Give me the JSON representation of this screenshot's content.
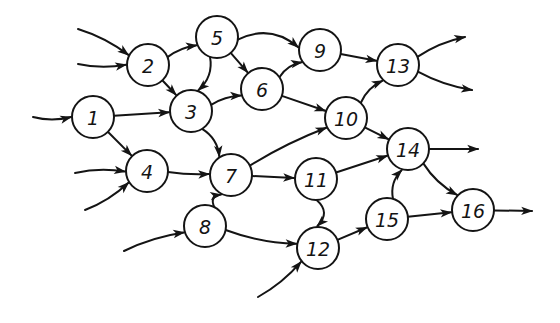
{
  "diagram": {
    "type": "directed-graph",
    "style": "hand-drawn",
    "colors": {
      "ink": "#141414",
      "background": "#ffffff"
    },
    "nodes": [
      {
        "id": "1",
        "label": "1"
      },
      {
        "id": "2",
        "label": "2"
      },
      {
        "id": "3",
        "label": "3"
      },
      {
        "id": "4",
        "label": "4"
      },
      {
        "id": "5",
        "label": "5"
      },
      {
        "id": "6",
        "label": "6"
      },
      {
        "id": "7",
        "label": "7"
      },
      {
        "id": "8",
        "label": "8"
      },
      {
        "id": "9",
        "label": "9"
      },
      {
        "id": "10",
        "label": "10"
      },
      {
        "id": "11",
        "label": "11"
      },
      {
        "id": "12",
        "label": "12"
      },
      {
        "id": "13",
        "label": "13"
      },
      {
        "id": "14",
        "label": "14"
      },
      {
        "id": "15",
        "label": "15"
      },
      {
        "id": "16",
        "label": "16"
      }
    ],
    "edges": [
      {
        "from": "1",
        "to": "3"
      },
      {
        "from": "1",
        "to": "4"
      },
      {
        "from": "2",
        "to": "5"
      },
      {
        "from": "2",
        "to": "3"
      },
      {
        "from": "5",
        "to": "3"
      },
      {
        "from": "5",
        "to": "6"
      },
      {
        "from": "5",
        "to": "9"
      },
      {
        "from": "3",
        "to": "6"
      },
      {
        "from": "3",
        "to": "7"
      },
      {
        "from": "6",
        "to": "9"
      },
      {
        "from": "6",
        "to": "10"
      },
      {
        "from": "4",
        "to": "7"
      },
      {
        "from": "8",
        "to": "7"
      },
      {
        "from": "8",
        "to": "12"
      },
      {
        "from": "7",
        "to": "10"
      },
      {
        "from": "7",
        "to": "11"
      },
      {
        "from": "9",
        "to": "13"
      },
      {
        "from": "10",
        "to": "13"
      },
      {
        "from": "10",
        "to": "14"
      },
      {
        "from": "11",
        "to": "14"
      },
      {
        "from": "11",
        "to": "12"
      },
      {
        "from": "12",
        "to": "15"
      },
      {
        "from": "15",
        "to": "14"
      },
      {
        "from": "15",
        "to": "16"
      },
      {
        "from": "14",
        "to": "16"
      }
    ],
    "inputs": [
      {
        "to": "1"
      },
      {
        "to": "2"
      },
      {
        "to": "2"
      },
      {
        "to": "4"
      },
      {
        "to": "4"
      },
      {
        "to": "8"
      },
      {
        "to": "12"
      }
    ],
    "outputs": [
      {
        "from": "13"
      },
      {
        "from": "13"
      },
      {
        "from": "14"
      },
      {
        "from": "16"
      }
    ]
  }
}
